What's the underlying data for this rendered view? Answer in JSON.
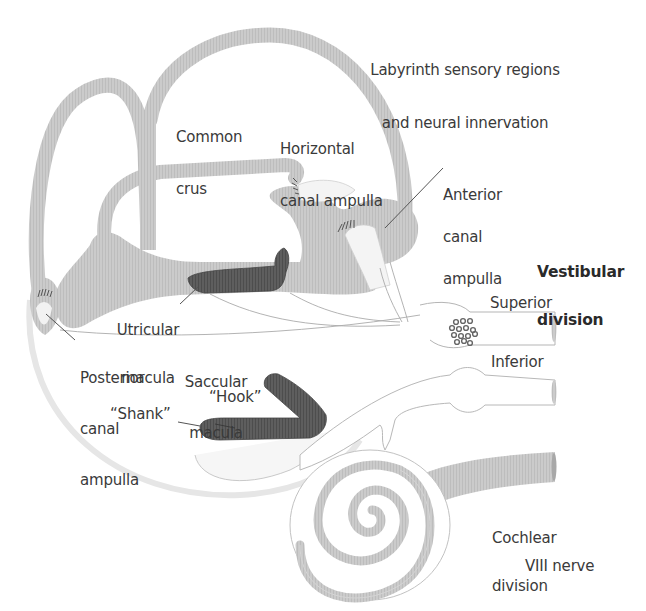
{
  "title": {
    "line1": "Labyrinth sensory regions",
    "line2": "and neural innervation"
  },
  "labels": {
    "common_crus": {
      "line1": "Common",
      "line2": "crus"
    },
    "horizontal_canal_ampulla": {
      "line1": "Horizontal",
      "line2": "canal ampulla"
    },
    "anterior_canal_ampulla": {
      "line1": "Anterior",
      "line2": "canal",
      "line3": "ampulla"
    },
    "vestibular_division": {
      "line1": "Vestibular",
      "line2": "division"
    },
    "utricular_macula": {
      "line1": "Utricular",
      "line2": "macula"
    },
    "posterior_canal_ampulla": {
      "line1": "Posterior",
      "line2": "canal",
      "line3": "ampulla"
    },
    "saccular_macula": {
      "line1": "Saccular",
      "line2": "macula"
    },
    "hook": "“Hook”",
    "shank": "“Shank”",
    "superior": "Superior",
    "inferior": "Inferior",
    "cochlear_division": {
      "line1": "Cochlear",
      "line2": "division"
    },
    "viii_nerve": "VIII nerve"
  },
  "colors": {
    "canal_fill": "#c8c8c8",
    "canal_highlight": "#dcdcdc",
    "macula_fill": "#5a5a5a",
    "nerve_outline": "#9a9a9a",
    "text": "#3a3a3a",
    "leader": "#555555"
  }
}
